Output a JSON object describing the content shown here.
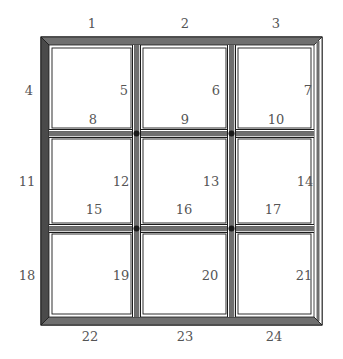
{
  "diagram": {
    "type": "matchstick-grid",
    "colors": {
      "bar_fill": "#6f6f6f",
      "bar_outline": "#1a1a1a",
      "bar_highlight": "#ffffff",
      "background": "#ffffff",
      "label": "#555555"
    },
    "labels": {
      "l1": "1",
      "l2": "2",
      "l3": "3",
      "l4": "4",
      "l5": "5",
      "l6": "6",
      "l7": "7",
      "l8": "8",
      "l9": "9",
      "l10": "10",
      "l11": "11",
      "l12": "12",
      "l13": "13",
      "l14": "14",
      "l15": "15",
      "l16": "16",
      "l17": "17",
      "l18": "18",
      "l19": "19",
      "l20": "20",
      "l21": "21",
      "l22": "22",
      "l23": "23",
      "l24": "24"
    },
    "bars": {
      "horizontal_rows": [
        [
          "1",
          "2",
          "3"
        ],
        [
          "8",
          "9",
          "10"
        ],
        [
          "15",
          "16",
          "17"
        ],
        [
          "22",
          "23",
          "24"
        ]
      ],
      "vertical_rows": [
        [
          "4",
          "5",
          "6",
          "7"
        ],
        [
          "11",
          "12",
          "13",
          "14"
        ],
        [
          "18",
          "19",
          "20",
          "21"
        ]
      ]
    }
  }
}
